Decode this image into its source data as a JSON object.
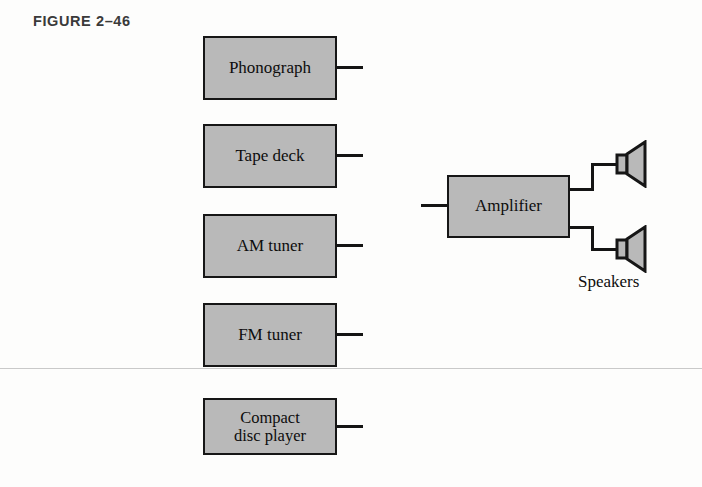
{
  "figure": {
    "title": "FIGURE  2–46"
  },
  "colors": {
    "box_fill": "#b9b9b9",
    "box_border": "#161616",
    "wire": "#141414",
    "page_background": "#fdfdfc",
    "scan_line": "#c9c9c9"
  },
  "sources": [
    {
      "label": "Phonograph",
      "name": "phonograph"
    },
    {
      "label": "Tape deck",
      "name": "tape-deck"
    },
    {
      "label": "AM tuner",
      "name": "am-tuner"
    },
    {
      "label": "FM tuner",
      "name": "fm-tuner"
    },
    {
      "label_line1": "Compact",
      "label_line2": "disc player",
      "name": "compact-disc-player"
    }
  ],
  "amplifier": {
    "label": "Amplifier"
  },
  "speakers": {
    "label": "Speakers",
    "count": 2,
    "icon": "speaker-icon"
  }
}
